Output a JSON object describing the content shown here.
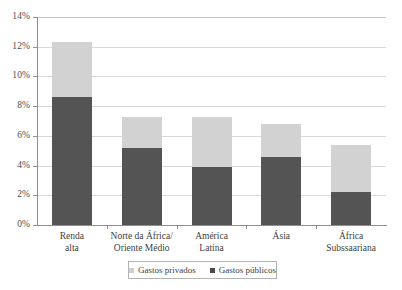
{
  "chart_data": {
    "type": "bar",
    "subtype": "stacked-vertical",
    "title": "",
    "xlabel": "",
    "ylabel": "",
    "ylim": [
      0,
      14
    ],
    "ytick_values": [
      0,
      2,
      4,
      6,
      8,
      10,
      12,
      14
    ],
    "ytick_labels": [
      "0%",
      "2%",
      "4%",
      "6%",
      "8%",
      "10%",
      "12%",
      "14%"
    ],
    "grid": true,
    "grid_axis": "y",
    "legend_position": "bottom",
    "categories": [
      "Renda alta",
      "Norte da África/ Oriente Médio",
      "América Latina",
      "Ásia",
      "África Subssaariana"
    ],
    "category_lines": [
      [
        "Renda",
        "alta"
      ],
      [
        "Norte da África/",
        "Oriente Médio"
      ],
      [
        "América",
        "Latina"
      ],
      [
        "Ásia",
        ""
      ],
      [
        "África",
        "Subssaariana"
      ]
    ],
    "series": [
      {
        "name": "Gastos públicos",
        "color": "#545454",
        "values": [
          8.6,
          5.2,
          3.9,
          4.6,
          2.2
        ]
      },
      {
        "name": "Gastos privados",
        "color": "#d2d2d2",
        "values": [
          3.7,
          2.1,
          3.4,
          2.2,
          3.2
        ]
      }
    ],
    "totals": [
      12.3,
      7.3,
      7.3,
      6.8,
      5.4
    ]
  },
  "legend": {
    "items": [
      {
        "label": "Gastos privados",
        "swatch": "private"
      },
      {
        "label": "Gastos públicos",
        "swatch": "public"
      }
    ]
  },
  "colors": {
    "private": "#d2d2d2",
    "public": "#545454",
    "axis": "#8f8f8f",
    "grid": "#d8d8d8",
    "text": "#3e3e3e",
    "background": "#ffffff"
  }
}
